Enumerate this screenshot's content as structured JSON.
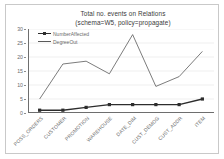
{
  "chart_data": {
    "type": "line",
    "title": "Total no. events on Relations",
    "subtitle": "(schema=W5, policy=propagate)",
    "title_lines": [
      "Total no. events on Relations",
      "(schema=W5, policy=propagate)"
    ],
    "categories": [
      "POSS_ORDERS",
      "CUSTOMER",
      "PROMOTION",
      "WAREHOUSE",
      "DATE_DIM",
      "CUST_DEMOG",
      "CUST_ADDR",
      "ITEM"
    ],
    "series": [
      {
        "name": "NumberAffected",
        "values": [
          1,
          1,
          2,
          3,
          3,
          3,
          3,
          5
        ],
        "marker": "square",
        "color": "#2d2d2d",
        "line_width": 1.4
      },
      {
        "name": "DegreeOut",
        "values": [
          5,
          17.5,
          18.5,
          14,
          28,
          9.5,
          13,
          22
        ],
        "marker": "none",
        "color": "#5a5a5a",
        "line_width": 0.8
      }
    ],
    "xlabel": "",
    "ylabel": "",
    "ylim": [
      0,
      30
    ],
    "yticks": [
      0,
      5,
      10,
      15,
      20,
      25,
      30
    ],
    "ytick_labels": [
      "0",
      "5",
      "10",
      "15",
      "20",
      "25",
      "30"
    ],
    "grid": true,
    "grid_axis": "y",
    "grid_color": "#e4e4e4",
    "legend_position": "inside-top-left",
    "legend_entries": [
      "NumberAffected",
      "DegreeOut"
    ],
    "plot_background": "#ffffff",
    "axis_color": "#6e6e6e",
    "text_color": "#6b6b6b",
    "border_color": "#c9c9c9"
  }
}
